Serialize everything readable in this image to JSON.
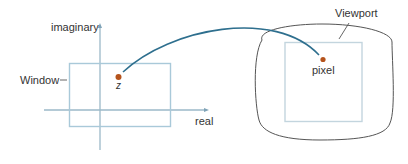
{
  "diagram": {
    "colors": {
      "axis": "#9bb8c8",
      "window_rect": "#a9c9d9",
      "viewport_rect": "#c3d5de",
      "screen_outline": "#555555",
      "arc": "#2e6f8e",
      "point": "#b5531c",
      "text": "#333333"
    },
    "complex_plane": {
      "y_axis_label": "imaginary",
      "x_axis_label": "real",
      "window_label": "Window",
      "point_label": "z"
    },
    "screen": {
      "viewport_label": "Viewport",
      "pixel_label": "pixel"
    }
  }
}
